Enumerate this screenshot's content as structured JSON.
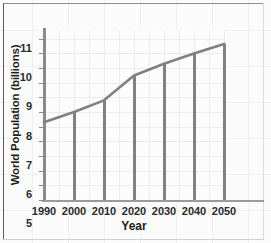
{
  "chart_data": {
    "type": "line",
    "title": "",
    "subtitle": "",
    "xlabel": "Year",
    "ylabel": "World Population (billions)",
    "x": [
      1990,
      2000,
      2010,
      2020,
      2030,
      2040,
      2050
    ],
    "xtick_labels": [
      "1990",
      "2000",
      "2010",
      "2020",
      "2030",
      "2040",
      "2050"
    ],
    "values": [
      5.3,
      6.0,
      6.8,
      8.5,
      9.3,
      10.0,
      10.65
    ],
    "ytick_labels": [
      "0",
      "1",
      "2",
      "3",
      "4",
      "5",
      "6",
      "7",
      "8",
      "9",
      "10",
      "11"
    ],
    "yticks": [
      0,
      1,
      2,
      3,
      4,
      5,
      6,
      7,
      8,
      9,
      10,
      11
    ],
    "ylim": [
      0,
      11.6
    ],
    "xlim": [
      1990,
      2050
    ],
    "grid": true,
    "legend": false,
    "legend_position": "none",
    "drop_lines_at": [
      2000,
      2010,
      2020,
      2030,
      2040,
      2050
    ],
    "annotations": [],
    "colors": {
      "line": "#818181",
      "drop_line": "#818181",
      "axis": "#8a8a8a",
      "grid": "#ececec",
      "plot_background": "#fcfcfc",
      "page_background": "#fbfbfb",
      "text": "#1c1c1c"
    }
  }
}
